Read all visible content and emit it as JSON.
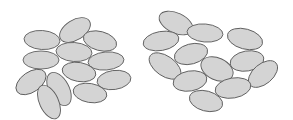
{
  "diagram": {
    "style": {
      "fill": "#d4d4d4",
      "stroke": "#5e5e5e",
      "background": "#ffffff"
    },
    "panels": [
      {
        "name": "left-cluster-dense",
        "ellipses": [
          {
            "cx": 75,
            "cy": 30,
            "rx": 17,
            "ry": 10,
            "rot": -32
          },
          {
            "cx": 42,
            "cy": 40,
            "rx": 18,
            "ry": 9.5,
            "rot": 4
          },
          {
            "cx": 100,
            "cy": 41,
            "rx": 17,
            "ry": 9.5,
            "rot": 15
          },
          {
            "cx": 74,
            "cy": 52,
            "rx": 18,
            "ry": 9.5,
            "rot": 4
          },
          {
            "cx": 41,
            "cy": 60,
            "rx": 18,
            "ry": 9,
            "rot": 0
          },
          {
            "cx": 106,
            "cy": 61,
            "rx": 18,
            "ry": 9,
            "rot": -5
          },
          {
            "cx": 79,
            "cy": 72,
            "rx": 17,
            "ry": 9.5,
            "rot": 10
          },
          {
            "cx": 31,
            "cy": 82,
            "rx": 17,
            "ry": 10,
            "rot": -35
          },
          {
            "cx": 114,
            "cy": 80,
            "rx": 17,
            "ry": 9.5,
            "rot": -8
          },
          {
            "cx": 90,
            "cy": 93,
            "rx": 17,
            "ry": 9.5,
            "rot": 10
          },
          {
            "cx": 59,
            "cy": 89,
            "rx": 18,
            "ry": 10,
            "rot": 62
          },
          {
            "cx": 49,
            "cy": 102,
            "rx": 18,
            "ry": 9.5,
            "rot": 65
          }
        ]
      },
      {
        "name": "right-cluster-sparse",
        "ellipses": [
          {
            "cx": 176,
            "cy": 23,
            "rx": 18,
            "ry": 10,
            "rot": 25
          },
          {
            "cx": 161,
            "cy": 41,
            "rx": 18,
            "ry": 9.5,
            "rot": -10
          },
          {
            "cx": 205,
            "cy": 33,
            "rx": 18,
            "ry": 9,
            "rot": 5
          },
          {
            "cx": 245,
            "cy": 39,
            "rx": 18,
            "ry": 10,
            "rot": 15
          },
          {
            "cx": 191,
            "cy": 54,
            "rx": 17,
            "ry": 10,
            "rot": -15
          },
          {
            "cx": 165,
            "cy": 66,
            "rx": 18,
            "ry": 10,
            "rot": 35
          },
          {
            "cx": 217,
            "cy": 69,
            "rx": 17,
            "ry": 11,
            "rot": 25
          },
          {
            "cx": 247,
            "cy": 61,
            "rx": 17,
            "ry": 10,
            "rot": -10
          },
          {
            "cx": 263,
            "cy": 74,
            "rx": 17,
            "ry": 10,
            "rot": -40
          },
          {
            "cx": 190,
            "cy": 81,
            "rx": 17,
            "ry": 10,
            "rot": -10
          },
          {
            "cx": 233,
            "cy": 88,
            "rx": 18,
            "ry": 10,
            "rot": -10
          },
          {
            "cx": 206,
            "cy": 101,
            "rx": 17,
            "ry": 10,
            "rot": 15
          }
        ]
      }
    ]
  }
}
